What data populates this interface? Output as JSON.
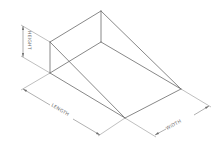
{
  "diagram": {
    "type": "isometric wedge (ramp) dimension drawing",
    "colors": {
      "line": "#6a6a6a",
      "background": "#ffffff"
    },
    "labels": {
      "height": "HEIGHT",
      "length": "LENGTH",
      "width": "WIDTH"
    },
    "vertices": {
      "front_left_top": [
        50,
        42
      ],
      "front_left_bottom": [
        50,
        73
      ],
      "back_top": [
        101,
        11
      ],
      "back_bottom": [
        101,
        42
      ],
      "right_far": [
        181,
        89
      ],
      "bottom_front": [
        125,
        118
      ]
    }
  }
}
